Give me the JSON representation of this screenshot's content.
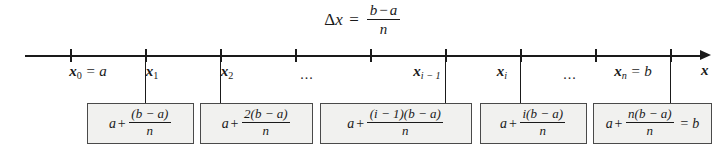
{
  "figure": {
    "type": "number-line-partition-diagram",
    "background_color": "#ffffff",
    "ink_color": "#1a1a1a",
    "box_fill_color": "#f1f1ef",
    "box_border_color": "#4a4a4a"
  },
  "title_formula": {
    "lhs_delta": "Δ",
    "lhs_var": "x",
    "equals": "=",
    "numerator_left": "b",
    "numerator_op": "−",
    "numerator_right": "a",
    "denominator": "n",
    "plain": "Δx = (b − a)/n"
  },
  "axis": {
    "label": "x",
    "arrow_direction": "right",
    "line_start_px": 25,
    "line_end_px": 711,
    "line_y_px": 55,
    "tick_count": 9,
    "tick_positions_px": [
      70,
      145,
      220,
      295,
      370,
      445,
      520,
      595,
      670
    ]
  },
  "tick_labels": [
    {
      "name": "x0",
      "base": "x",
      "sub": "0",
      "suffix": " = a",
      "x_px": 88,
      "plain": "x₀ = a"
    },
    {
      "name": "x1",
      "base": "x",
      "sub": "1",
      "suffix": "",
      "x_px": 152,
      "plain": "x₁"
    },
    {
      "name": "x2",
      "base": "x",
      "sub": "2",
      "suffix": "",
      "x_px": 227,
      "plain": "x₂"
    },
    {
      "name": "xi-1",
      "base": "x",
      "sub": "i − 1",
      "suffix": "",
      "x_px": 427,
      "plain": "xᵢ₋₁"
    },
    {
      "name": "xi",
      "base": "x",
      "sub": "i",
      "suffix": "",
      "x_px": 502,
      "plain": "xᵢ"
    },
    {
      "name": "xn",
      "base": "x",
      "sub": "n",
      "suffix": " = b",
      "x_px": 633,
      "plain": "xₙ = b"
    }
  ],
  "axis_ellipses": [
    {
      "name": "ellipsis-left",
      "text": "...",
      "x_px": 307
    },
    {
      "name": "ellipsis-right",
      "text": "...",
      "x_px": 570
    }
  ],
  "boxes": [
    {
      "name": "box-x1",
      "left_px": 87,
      "width_px": 107,
      "connector_x_px": 145,
      "lead": "a",
      "plus": "+",
      "numerator": "(b − a)",
      "denominator": "n",
      "trailing": "",
      "plain": "a + (b − a)/n"
    },
    {
      "name": "box-x2",
      "left_px": 200,
      "width_px": 113,
      "connector_x_px": 220,
      "lead": "a",
      "plus": "+",
      "numerator": "2(b − a)",
      "denominator": "n",
      "trailing": "",
      "plain": "a + 2(b − a)/n"
    },
    {
      "name": "box-xi-1",
      "left_px": 320,
      "width_px": 152,
      "connector_x_px": 445,
      "lead": "a",
      "plus": "+",
      "numerator": "(i − 1)(b − a)",
      "denominator": "n",
      "trailing": "",
      "plain": "a + (i − 1)(b − a)/n"
    },
    {
      "name": "box-xi",
      "left_px": 480,
      "width_px": 107,
      "connector_x_px": 520,
      "lead": "a",
      "plus": "+",
      "numerator": "i(b − a)",
      "denominator": "n",
      "trailing": "",
      "plain": "a + i(b − a)/n"
    },
    {
      "name": "box-xn",
      "left_px": 593,
      "width_px": 119,
      "connector_x_px": 670,
      "lead": "a",
      "plus": "+",
      "numerator": "n(b − a)",
      "denominator": "n",
      "trailing": "= b",
      "plain": "a + n(b − a)/n = b"
    }
  ]
}
